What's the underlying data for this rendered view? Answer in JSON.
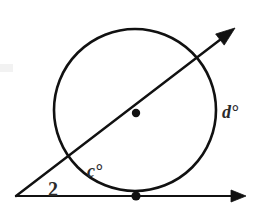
{
  "figure": {
    "kind": "geometry-diagram",
    "background_color": "#ffffff",
    "ink_color": "#111111",
    "label_color": "#2b2b2b",
    "canvas": {
      "width": 257,
      "height": 210
    }
  },
  "circle": {
    "center_x": 135,
    "center_y": 110,
    "radius": 81,
    "stroke_width": 2.6,
    "center_dot_radius": 4.2
  },
  "tangent_line": {
    "name": "tangent-line",
    "x1": 16,
    "y1": 196,
    "x2": 246,
    "y2": 196,
    "stroke_width": 2.2,
    "arrow_end": "right",
    "tangent_point_x": 136,
    "tangent_point_y": 196,
    "tangent_dot_radius": 4.6
  },
  "secant_line": {
    "name": "secant-line",
    "x1": 16,
    "y1": 196,
    "x2": 235,
    "y2": 28,
    "stroke_width": 2.4,
    "arrow_end": "upper-right",
    "entry_x": 62,
    "entry_y": 158,
    "exit_x": 197,
    "exit_y": 55
  },
  "vertex": {
    "name": "external-vertex",
    "x": 16,
    "y": 196
  },
  "labels": [
    {
      "id": "angle-2",
      "text": "2",
      "x": 48,
      "y": 196,
      "font_size": 20,
      "italic": false,
      "meaning": "exterior angle formed by tangent and secant"
    },
    {
      "id": "arc-c",
      "text": "c°",
      "x": 87,
      "y": 177,
      "font_size": 18,
      "italic": true,
      "meaning": "near arc measure between tangent point and secant entry"
    },
    {
      "id": "arc-d",
      "text": "d°",
      "x": 222,
      "y": 118,
      "font_size": 18,
      "italic": true,
      "meaning": "far arc measure between secant exit and tangent point"
    }
  ]
}
